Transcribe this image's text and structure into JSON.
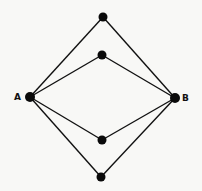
{
  "diagram": {
    "nodes": [
      {
        "id": "A",
        "label": "A",
        "x": 30,
        "y": 97
      },
      {
        "id": "B",
        "label": "B",
        "x": 175,
        "y": 98
      },
      {
        "id": "n1",
        "label": "",
        "x": 103,
        "y": 17
      },
      {
        "id": "n2",
        "label": "",
        "x": 102,
        "y": 55
      },
      {
        "id": "n3",
        "label": "",
        "x": 102,
        "y": 140
      },
      {
        "id": "n4",
        "label": "",
        "x": 101,
        "y": 177
      }
    ],
    "edges": [
      [
        "A",
        "n1"
      ],
      [
        "n1",
        "B"
      ],
      [
        "A",
        "n2"
      ],
      [
        "n2",
        "B"
      ],
      [
        "A",
        "n3"
      ],
      [
        "n3",
        "B"
      ],
      [
        "A",
        "n4"
      ],
      [
        "n4",
        "B"
      ]
    ],
    "labels": {
      "a": "A",
      "b": "B"
    },
    "colors": {
      "line": "#111111",
      "node": "#0a0a0a",
      "background": "#f8f8f6"
    }
  }
}
